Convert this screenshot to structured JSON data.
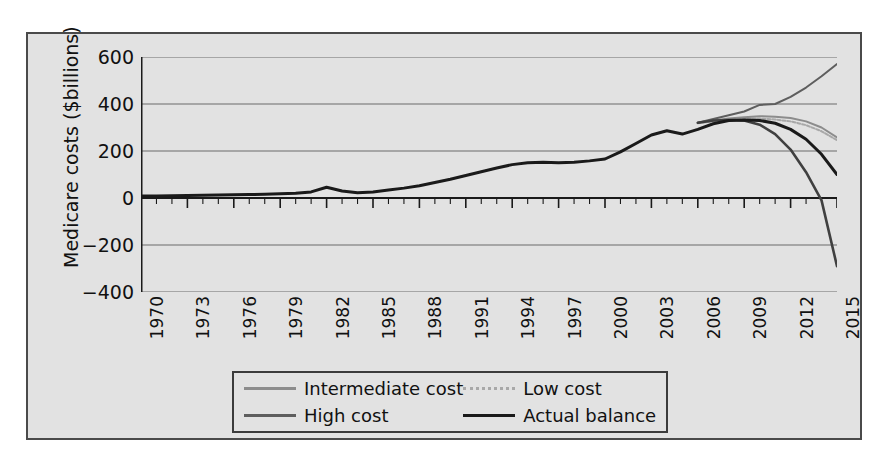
{
  "chart_data": {
    "type": "line",
    "title": "",
    "xlabel": "Year",
    "ylabel": "Medicare costs ($billions)",
    "xlim": [
      1970,
      2015
    ],
    "ylim": [
      -400,
      600
    ],
    "yticks": [
      600,
      400,
      200,
      0,
      -200,
      -400
    ],
    "ytick_labels": [
      "600",
      "400",
      "200",
      "0",
      "−200",
      "−400"
    ],
    "xticks": [
      1970,
      1973,
      1976,
      1979,
      1982,
      1985,
      1988,
      1991,
      1994,
      1997,
      2000,
      2003,
      2006,
      2009,
      2012,
      2015
    ],
    "xtick_labels": [
      "1970",
      "1973",
      "1976",
      "1979",
      "1982",
      "1985",
      "1988",
      "1991",
      "1994",
      "1997",
      "2000",
      "2003",
      "2006",
      "2009",
      "2012",
      "2015"
    ],
    "minor_xtick_step": 1,
    "grid": "horizontal",
    "legend_position": "below-axes",
    "series": [
      {
        "name": "Actual balance",
        "color": "#1a1a1a",
        "width": 3.0,
        "x": [
          1970,
          1971,
          1972,
          1973,
          1974,
          1975,
          1976,
          1977,
          1978,
          1979,
          1980,
          1981,
          1982,
          1983,
          1984,
          1985,
          1986,
          1987,
          1988,
          1989,
          1990,
          1991,
          1992,
          1993,
          1994,
          1995,
          1996,
          1997,
          1998,
          1999,
          2000,
          2001,
          2002,
          2003,
          2004,
          2005,
          2006,
          2007,
          2008,
          2009,
          2010,
          2011,
          2012,
          2013,
          2014,
          2015
        ],
        "y": [
          8,
          9,
          10,
          11,
          12,
          13,
          14,
          15,
          16,
          18,
          20,
          26,
          46,
          30,
          22,
          26,
          34,
          42,
          52,
          66,
          80,
          96,
          112,
          128,
          142,
          150,
          152,
          150,
          152,
          158,
          166,
          196,
          232,
          268,
          286,
          272,
          292,
          316,
          330,
          332,
          330,
          318,
          292,
          250,
          186,
          100
        ]
      },
      {
        "name": "High cost",
        "color": "#5e5e5e",
        "width": 2.0,
        "x": [
          2006,
          2007,
          2008,
          2009,
          2010,
          2011,
          2012,
          2013,
          2014,
          2015
        ],
        "y": [
          320,
          336,
          352,
          368,
          396,
          400,
          430,
          470,
          518,
          570
        ]
      },
      {
        "name": "Intermediate cost",
        "color": "#8c8c8c",
        "width": 2.0,
        "x": [
          2006,
          2007,
          2008,
          2009,
          2010,
          2011,
          2012,
          2013,
          2014,
          2015
        ],
        "y": [
          320,
          330,
          338,
          344,
          348,
          346,
          340,
          326,
          300,
          258
        ]
      },
      {
        "name": "Low cost",
        "color": "#a8a8a8",
        "width": 2.0,
        "dash": "3 2",
        "x": [
          2006,
          2007,
          2008,
          2009,
          2010,
          2011,
          2012,
          2013,
          2014,
          2015
        ],
        "y": [
          318,
          326,
          332,
          336,
          338,
          334,
          326,
          310,
          284,
          246
        ]
      },
      {
        "name": "Actual balance projection",
        "color": "#404040",
        "width": 2.6,
        "x": [
          2006,
          2007,
          2008,
          2009,
          2010,
          2011,
          2012,
          2013,
          2014,
          2015
        ],
        "y": [
          320,
          330,
          332,
          330,
          312,
          272,
          206,
          110,
          -10,
          -290
        ]
      }
    ]
  },
  "axes": {
    "ylabel": "Medicare costs ($billions)",
    "xlabel": "Year"
  },
  "legend": {
    "items": [
      {
        "label": "Intermediate cost",
        "color": "#8c8c8c",
        "style": "solid"
      },
      {
        "label": "Low cost",
        "color": "#a8a8a8",
        "style": "dotted"
      },
      {
        "label": "High cost",
        "color": "#5e5e5e",
        "style": "solid"
      },
      {
        "label": "Actual balance",
        "color": "#1a1a1a",
        "style": "solid"
      }
    ]
  },
  "colors": {
    "background": "#e2e2e2",
    "frame": "#4a4a4a",
    "axis": "#1a1a1a",
    "grid": "#6a6a6a",
    "page": "#ffffff"
  }
}
